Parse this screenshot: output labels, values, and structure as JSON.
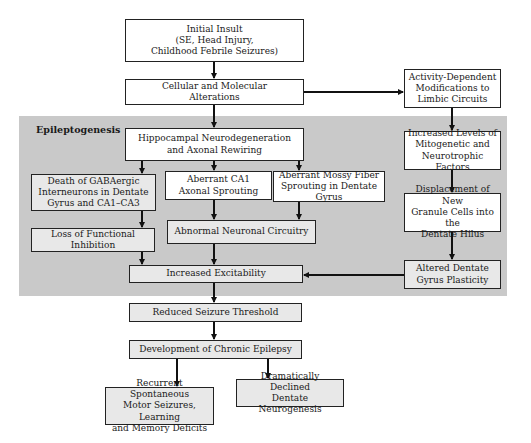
{
  "diagram": {
    "type": "flowchart",
    "region_label": "Epileptogenesis",
    "colors": {
      "band": "#c9c9c9",
      "box_white": "#ffffff",
      "box_shaded": "#e8e8e8",
      "stroke": "#222222"
    },
    "nodes": {
      "initial_insult": {
        "lines": [
          "Initial Insult",
          "(SE, Head Injury,",
          "Childhood Febrile Seizures)"
        ]
      },
      "cellular": {
        "lines": [
          "Cellular and Molecular",
          "Alterations"
        ]
      },
      "activity": {
        "lines": [
          "Activity-Dependent",
          "Modifications to",
          "Limbic Circuits"
        ]
      },
      "hippocampal": {
        "lines": [
          "Hippocampal Neurodegeneration",
          "and Axonal Rewiring"
        ]
      },
      "increased_levels": {
        "lines": [
          "Increased Levels of",
          "Mitogenetic and",
          "Neurotrophic Factors"
        ]
      },
      "gabaergic": {
        "lines": [
          "Death of GABAergic",
          "Interneurons in Dentate",
          "Gyrus and CA1–CA3"
        ]
      },
      "ca1": {
        "lines": [
          "Aberrant CA1",
          "Axonal Sprouting"
        ]
      },
      "mossy": {
        "lines": [
          "Aberrant Mossy Fiber",
          "Sprouting in Dentate Gyrus"
        ]
      },
      "displacement": {
        "lines": [
          "Displacement of New",
          "Granule Cells into the",
          "Dentate Hilus"
        ]
      },
      "loss_inhibition": {
        "lines": [
          "Loss of Functional Inhibition"
        ]
      },
      "abnormal_circuitry": {
        "lines": [
          "Abnormal Neuronal Circuitry"
        ]
      },
      "excitability": {
        "lines": [
          "Increased Excitability"
        ]
      },
      "altered_plasticity": {
        "lines": [
          "Altered Dentate",
          "Gyrus Plasticity"
        ]
      },
      "reduced_threshold": {
        "lines": [
          "Reduced Seizure Threshold"
        ]
      },
      "chronic_epilepsy": {
        "lines": [
          "Development of Chronic Epilepsy"
        ]
      },
      "recurrent": {
        "lines": [
          "Recurrent Spontaneous",
          "Motor Seizures, Learning",
          "and Memory Deficits"
        ]
      },
      "declined_neurogenesis": {
        "lines": [
          "Dramatically Declined",
          "Dentate Neurogenesis"
        ]
      }
    },
    "edges": [
      [
        "initial_insult",
        "cellular"
      ],
      [
        "cellular",
        "activity"
      ],
      [
        "cellular",
        "hippocampal"
      ],
      [
        "activity",
        "increased_levels"
      ],
      [
        "hippocampal",
        "gabaergic"
      ],
      [
        "hippocampal",
        "ca1"
      ],
      [
        "hippocampal",
        "mossy"
      ],
      [
        "increased_levels",
        "displacement"
      ],
      [
        "gabaergic",
        "loss_inhibition"
      ],
      [
        "ca1",
        "abnormal_circuitry"
      ],
      [
        "mossy",
        "abnormal_circuitry"
      ],
      [
        "displacement",
        "altered_plasticity"
      ],
      [
        "loss_inhibition",
        "excitability"
      ],
      [
        "abnormal_circuitry",
        "excitability"
      ],
      [
        "altered_plasticity",
        "excitability"
      ],
      [
        "excitability",
        "reduced_threshold"
      ],
      [
        "reduced_threshold",
        "chronic_epilepsy"
      ],
      [
        "chronic_epilepsy",
        "recurrent"
      ],
      [
        "chronic_epilepsy",
        "declined_neurogenesis"
      ]
    ]
  }
}
